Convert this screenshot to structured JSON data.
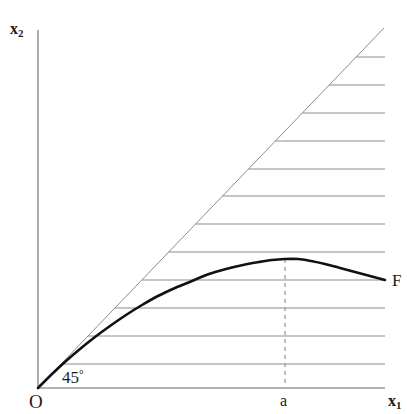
{
  "figure": {
    "background_color": "#ffffff",
    "width": 407,
    "height": 414
  },
  "labels": {
    "y_axis": {
      "text": "x",
      "subscript": "2",
      "name": "x2"
    },
    "x_axis": {
      "text": "x",
      "subscript": "1",
      "name": "x1"
    },
    "origin": "O",
    "peak_tick": "a",
    "angle": {
      "value": "45",
      "symbol": "°",
      "text": "45°"
    },
    "curve": "F"
  },
  "colors": {
    "axis": "#9a9a9a",
    "diagonal": "#8c8c8c",
    "hatch": "#8c8c8c",
    "curve": "#111111",
    "dashed": "#9a9a9a",
    "text": "#1a1a1a"
  },
  "chart_data": {
    "type": "line",
    "title": "",
    "subtitle": "",
    "xlabel": "x1",
    "ylabel": "x2",
    "xlim": [
      0,
      347
    ],
    "ylim": [
      0,
      358
    ],
    "grid": false,
    "legend_position": "none",
    "axes_pixels": {
      "origin_x": 38,
      "origin_y": 388,
      "x_axis_end_x": 385,
      "y_axis_top_y": 30
    },
    "annotations": [
      {
        "text": "45°",
        "x_px": 62,
        "y_px": 369,
        "describes": "angle between 45-degree ray and horizontal axis"
      },
      {
        "text": "O",
        "x_px": 29,
        "y_px": 392,
        "describes": "origin"
      },
      {
        "text": "a",
        "x_px": 280,
        "y_px": 393,
        "describes": "abscissa of curve maximum"
      },
      {
        "text": "F",
        "x_px": 392,
        "y_px": 272,
        "describes": "label of the production function curve"
      }
    ],
    "series": [
      {
        "name": "45-degree ray",
        "style": "thin-solid",
        "color": "#8c8c8c",
        "points_px": [
          [
            38,
            388
          ],
          [
            384,
            28
          ]
        ]
      },
      {
        "name": "F",
        "style": "thick-solid",
        "color": "#111111",
        "description": "concave curve tangent to the 45-degree ray at the origin, maximum at x = a, slowly decreasing thereafter",
        "points_px": [
          [
            38,
            388
          ],
          [
            52,
            374
          ],
          [
            66,
            361
          ],
          [
            80,
            349
          ],
          [
            95,
            337
          ],
          [
            110,
            326
          ],
          [
            126,
            315
          ],
          [
            142,
            305
          ],
          [
            158,
            296
          ],
          [
            175,
            288
          ],
          [
            192,
            281
          ],
          [
            209,
            274
          ],
          [
            226,
            269
          ],
          [
            243,
            265
          ],
          [
            259,
            262
          ],
          [
            272,
            260
          ],
          [
            285,
            259
          ],
          [
            298,
            259
          ],
          [
            311,
            261
          ],
          [
            325,
            264
          ],
          [
            340,
            268
          ],
          [
            355,
            272
          ],
          [
            370,
            276
          ],
          [
            385,
            280
          ]
        ]
      },
      {
        "name": "vertical dashed marker at a",
        "style": "dashed",
        "color": "#9a9a9a",
        "points_px": [
          [
            285,
            259
          ],
          [
            285,
            388
          ]
        ]
      }
    ],
    "hatching": {
      "description": "horizontal hatch lines filling the infeasible region above the 45-degree ray, drawn from the ray rightward to the plot edge",
      "color": "#8c8c8c",
      "orientation": "horizontal",
      "spacing_px": 28,
      "right_edge_x": 385,
      "line_y_values_px": [
        57,
        85,
        113,
        141,
        169,
        196,
        224,
        252,
        280,
        308,
        336,
        364
      ]
    }
  }
}
